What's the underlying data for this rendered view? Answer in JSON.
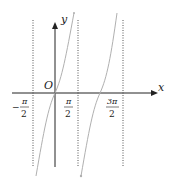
{
  "diagram": {
    "type": "function-graph",
    "function": "y = tan x",
    "axes": {
      "x_label": "x",
      "y_label": "y",
      "origin_label": "O"
    },
    "asymptotes": [
      {
        "name": "neg-pi-over-2",
        "numerator": "π",
        "denominator": "2",
        "sign": "−"
      },
      {
        "name": "pi-over-2",
        "numerator": "π",
        "denominator": "2",
        "sign": ""
      },
      {
        "name": "three-pi-over-2",
        "numerator": "3π",
        "denominator": "2",
        "sign": ""
      }
    ],
    "colors": {
      "axis": "#222222",
      "curve": "#b0b0b0",
      "asymptote": "#555555"
    }
  }
}
